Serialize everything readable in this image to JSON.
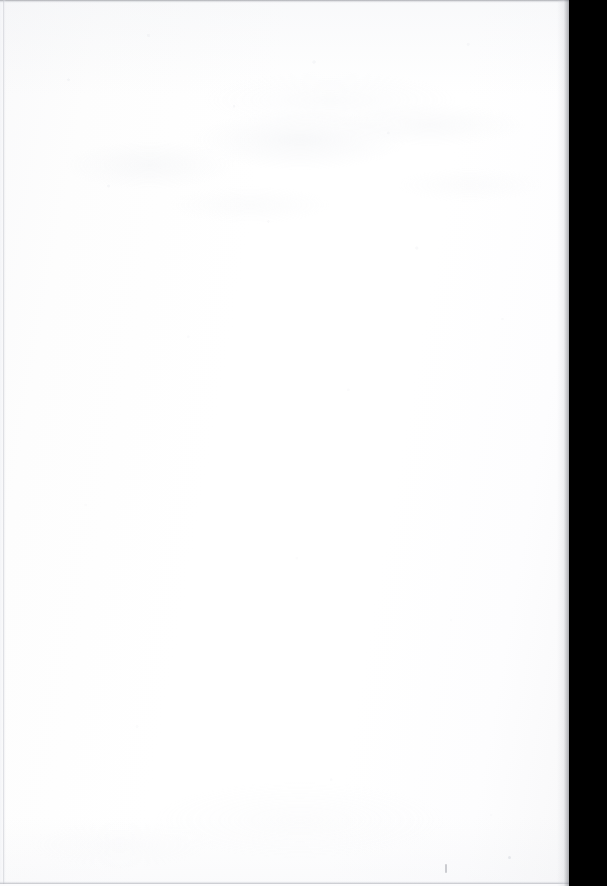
{
  "document": {
    "kind": "scanned-page",
    "content_state": "blank",
    "visible_text": "",
    "caption": "",
    "page_number": "",
    "width_px": 607,
    "height_px": 886
  },
  "page": {
    "paper_color": "#fdfdfd",
    "paper_highlight": "#ffffff",
    "paper_shadow": "#f8f8f9",
    "paper_width_px": 571,
    "paper_height_px": 886
  },
  "artifacts": {
    "gutter": {
      "label": "",
      "color": "#000000",
      "left_px": 569,
      "width_px": 38,
      "side": "right"
    },
    "top_edge": {
      "label": "",
      "color": "#96989e",
      "height_px": 3
    },
    "left_edge": {
      "label": "",
      "color": "#c4c6cd",
      "left_px": 3,
      "width_px": 3
    },
    "bottom_edge": {
      "label": "",
      "color": "#abadb4",
      "height_px": 3
    },
    "specks": [
      {
        "label": "",
        "x_px": 445,
        "y_px": 864
      },
      {
        "label": "",
        "x_px": 508,
        "y_px": 856
      }
    ],
    "show_through": {
      "label": "",
      "color": "#dbdee5",
      "region": "upper-third"
    }
  }
}
